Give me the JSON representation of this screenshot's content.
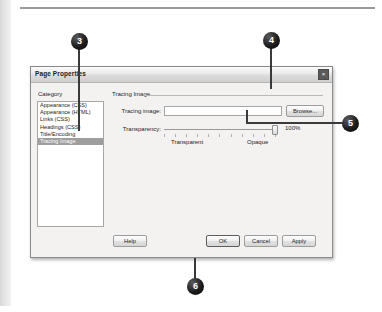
{
  "figure": {
    "callouts": [
      {
        "number": "3",
        "target": "category-list-tracing-image"
      },
      {
        "number": "4",
        "target": "browse-button"
      },
      {
        "number": "5",
        "target": "transparency-slider"
      },
      {
        "number": "6",
        "target": "ok-button"
      }
    ]
  },
  "dialog": {
    "title": "Page Properties",
    "window_buttons": {
      "close_glyph": "×"
    },
    "category": {
      "label": "Category",
      "items": [
        {
          "label": "Appearance (CSS)",
          "selected": false
        },
        {
          "label": "Appearance (HTML)",
          "selected": false
        },
        {
          "label": "Links (CSS)",
          "selected": false
        },
        {
          "label": "Headings (CSS)",
          "selected": false
        },
        {
          "label": "Title/Encoding",
          "selected": false
        },
        {
          "label": "Tracing Image",
          "selected": true
        }
      ]
    },
    "panel": {
      "title": "Tracing Image",
      "tracing_image": {
        "label": "Tracing image:",
        "value": "",
        "placeholder": ""
      },
      "browse_button": "Browse...",
      "transparency": {
        "label": "Transparency:",
        "value_percent": "100%",
        "min_label": "Transparent",
        "max_label": "Opaque",
        "slider_position_percent": 100
      }
    },
    "buttons": {
      "help": "Help",
      "ok": "OK",
      "cancel": "Cancel",
      "apply": "Apply"
    }
  },
  "colors": {
    "dialog_face": "#f3f2f1",
    "selection": "#9e9e9e",
    "callout_fill": "#111111",
    "callout_text": "#ffffff",
    "border": "#8a8a8a"
  }
}
